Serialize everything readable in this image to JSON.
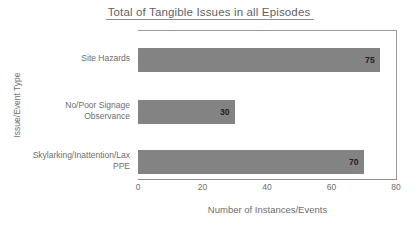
{
  "chart_data": {
    "type": "bar",
    "orientation": "horizontal",
    "title": "Total of Tangible Issues in all Episodes",
    "xlabel": "Number of Instances/Events",
    "ylabel": "Issue/Event Type",
    "categories": [
      "Site Hazards",
      "No/Poor Signage Observance",
      "Skylarking/Inattention/Lax PPE"
    ],
    "values": [
      75,
      30,
      70
    ],
    "value_labels": [
      "75",
      "30",
      "70"
    ],
    "xlim": [
      0,
      80
    ],
    "xticks": [
      0,
      20,
      40,
      60,
      80
    ],
    "xtick_labels": [
      "0",
      "20",
      "40",
      "60",
      "80"
    ],
    "grid": false,
    "legend": false,
    "bar_color": "#838383",
    "axis_color": "#9a9a9a",
    "text_color": "#6e6e6e",
    "value_label_color": "#1f1f1f",
    "background": "#ffffff"
  }
}
